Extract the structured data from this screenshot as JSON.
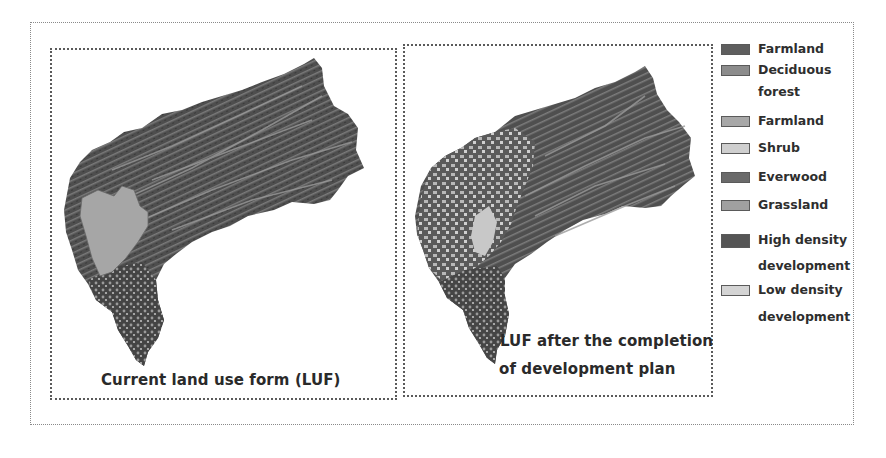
{
  "figure": {
    "panels": [
      {
        "id": "current",
        "caption_lines": [
          "Current land use form (LUF)"
        ]
      },
      {
        "id": "after-plan",
        "caption_lines": [
          "LUF after the completion",
          "of development plan"
        ]
      }
    ],
    "legend": [
      {
        "label_lines": [
          "Farmland"
        ],
        "color": "#5e5e5e"
      },
      {
        "label_lines": [
          "Deciduous",
          "forest"
        ],
        "color": "#8c8c8c"
      },
      {
        "label_lines": [
          "Farmland"
        ],
        "color": "#a8a8a8"
      },
      {
        "label_lines": [
          "Shrub"
        ],
        "color": "#cfcfcf"
      },
      {
        "label_lines": [
          "Everwood"
        ],
        "color": "#6a6a6a"
      },
      {
        "label_lines": [
          "Grassland"
        ],
        "color": "#a0a0a0"
      },
      {
        "label_lines": [
          "High density",
          "development"
        ],
        "color": "#555555"
      },
      {
        "label_lines": [
          "Low density",
          "development"
        ],
        "color": "#d4d4d4"
      }
    ]
  }
}
